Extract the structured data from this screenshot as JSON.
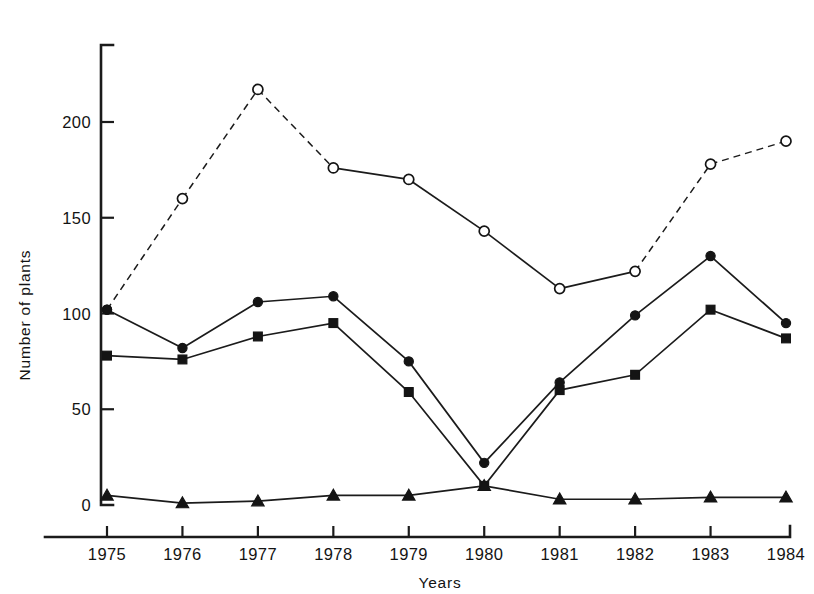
{
  "figure": {
    "top_fragment": ""
  },
  "axes": {
    "y_title": "Number of plants",
    "x_title": "Years",
    "y_ticks": [
      0,
      50,
      100,
      150,
      200
    ],
    "y_tick_labels": [
      "0",
      "50",
      "100",
      "150",
      "200"
    ],
    "x_tick_labels": [
      "1975",
      "1976",
      "1977",
      "1978",
      "1979",
      "1980",
      "1981",
      "1982",
      "1983",
      "1984"
    ]
  },
  "chart_data": {
    "type": "line",
    "title": "",
    "xlabel": "Years",
    "ylabel": "Number of plants",
    "x": [
      1975,
      1976,
      1977,
      1978,
      1979,
      1980,
      1981,
      1982,
      1983,
      1984
    ],
    "categories": [
      "1975",
      "1976",
      "1977",
      "1978",
      "1979",
      "1980",
      "1981",
      "1982",
      "1983",
      "1984"
    ],
    "xlim": [
      1975,
      1984
    ],
    "ylim": [
      0,
      235
    ],
    "grid": false,
    "legend": "none",
    "series": [
      {
        "name": "open-circle-series",
        "marker": "open-circle",
        "linestyle": "mixed-dashed",
        "values": [
          102,
          160,
          217,
          176,
          170,
          143,
          113,
          122,
          178,
          190
        ],
        "dashed_segments": [
          [
            0,
            1
          ],
          [
            1,
            2
          ],
          [
            2,
            3
          ],
          [
            7,
            8
          ],
          [
            8,
            9
          ]
        ],
        "solid_segments": [
          [
            3,
            4
          ],
          [
            4,
            5
          ],
          [
            5,
            6
          ],
          [
            6,
            7
          ]
        ],
        "first_point_filled": true
      },
      {
        "name": "filled-circle-series",
        "marker": "filled-circle",
        "linestyle": "solid",
        "values": [
          102,
          82,
          106,
          109,
          75,
          22,
          64,
          99,
          130,
          95
        ]
      },
      {
        "name": "filled-square-series",
        "marker": "filled-square",
        "linestyle": "solid",
        "values": [
          78,
          76,
          88,
          95,
          59,
          10,
          60,
          68,
          102,
          87
        ]
      },
      {
        "name": "filled-triangle-series",
        "marker": "filled-triangle",
        "linestyle": "solid",
        "values": [
          5,
          1,
          2,
          5,
          5,
          10,
          3,
          3,
          4,
          4
        ]
      }
    ]
  }
}
